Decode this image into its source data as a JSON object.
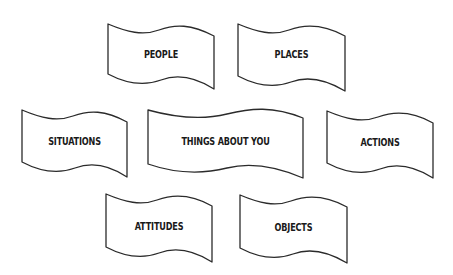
{
  "diagram": {
    "type": "banner-grid",
    "stroke_color": "#2b2b2b",
    "fill_color": "#ffffff",
    "text_color": "#1a1a1a",
    "banners": [
      {
        "id": "people",
        "label": "PEOPLE",
        "row": 1
      },
      {
        "id": "places",
        "label": "PLACES",
        "row": 1
      },
      {
        "id": "situations",
        "label": "SITUATIONS",
        "row": 2
      },
      {
        "id": "things-about-you",
        "label": "THINGS ABOUT YOU",
        "row": 2
      },
      {
        "id": "actions",
        "label": "ACTIONS",
        "row": 2
      },
      {
        "id": "attitudes",
        "label": "ATTITUDES",
        "row": 3
      },
      {
        "id": "objects",
        "label": "OBJECTS",
        "row": 3
      }
    ]
  }
}
